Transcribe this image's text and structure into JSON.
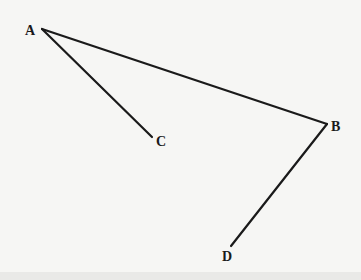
{
  "diagram": {
    "points": [
      {
        "name": "A",
        "label": "A"
      },
      {
        "name": "B",
        "label": "B"
      },
      {
        "name": "C",
        "label": "C"
      },
      {
        "name": "D",
        "label": "D"
      }
    ],
    "segments": [
      {
        "from": "A",
        "to": "B"
      },
      {
        "from": "A",
        "to": "C"
      },
      {
        "from": "B",
        "to": "D"
      }
    ],
    "stroke_color": "#1a1a1a",
    "background_color": "#f6f6f4"
  }
}
